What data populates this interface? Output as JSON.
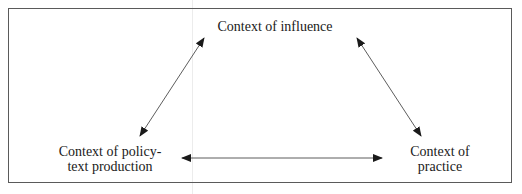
{
  "diagram": {
    "type": "policy-cycle-triangle",
    "nodes": [
      {
        "id": "influence",
        "label": "Context of influence"
      },
      {
        "id": "policy",
        "label_line1": "Context of policy-",
        "label_line2": "text production"
      },
      {
        "id": "practice",
        "label_line1": "Context of",
        "label_line2": "practice"
      }
    ],
    "edges": [
      {
        "from": "influence",
        "to": "policy",
        "direction": "bidirectional"
      },
      {
        "from": "influence",
        "to": "practice",
        "direction": "bidirectional"
      },
      {
        "from": "policy",
        "to": "practice",
        "direction": "bidirectional"
      }
    ],
    "colors": {
      "border": "#5a5a5a",
      "arrow": "#1a1a1a",
      "text": "#1a1a1a"
    }
  }
}
